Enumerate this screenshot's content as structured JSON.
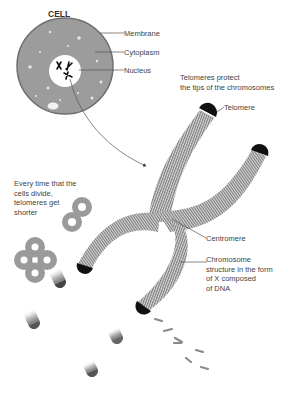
{
  "cell": {
    "title": "CELL",
    "labels": {
      "membrane": "Membrane",
      "cytoplasm": "Cytoplasm",
      "nucleus": "Nucleus"
    }
  },
  "telomere": {
    "caption_line1": "Telomeres protect",
    "caption_line2": "the tips of the chromosomes",
    "label": "Telomere"
  },
  "division": {
    "line1": "Every time that the",
    "line2": "cells divide,",
    "line3": "telomeres get",
    "line4": "shorter"
  },
  "centromere": {
    "label": "Centromere"
  },
  "chromosome": {
    "line1": "Chromosome",
    "line2": "structure in the form",
    "line3": "of X composed",
    "line4": "of DNA"
  },
  "colors": {
    "cytoplasm": "#9a9a9a",
    "membrane": "#7a7a7a",
    "nucleus": "#ffffff",
    "telomere": "#111111",
    "chromatid_stripe": "#8a8a8a",
    "leader": "#555555"
  }
}
